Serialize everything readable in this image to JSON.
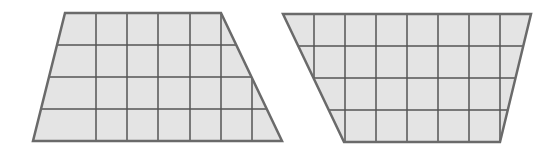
{
  "colors": {
    "fill": "#e4e4e4",
    "grid": "#555555",
    "outline": "#6a6a6a",
    "background": "#ffffff"
  },
  "shapes": [
    {
      "name": "left-trapezoid",
      "rows": 4,
      "top_cells": 5,
      "bottom_cells": 7,
      "polygon": [
        [
          65,
          13
        ],
        [
          221,
          13
        ],
        [
          282,
          141
        ],
        [
          33,
          141
        ]
      ],
      "vertical_lines_x": [
        96,
        127,
        158,
        190,
        221,
        252
      ],
      "horizontal_lines_y": [
        45,
        77,
        109
      ]
    },
    {
      "name": "right-trapezoid",
      "rows": 4,
      "top_cells": 8,
      "bottom_cells": 5,
      "polygon": [
        [
          283,
          14
        ],
        [
          531,
          14
        ],
        [
          500,
          142
        ],
        [
          344,
          142
        ]
      ],
      "vertical_lines_x": [
        314,
        345,
        376,
        407,
        438,
        469,
        500
      ],
      "horizontal_lines_y": [
        46,
        78,
        110
      ]
    }
  ]
}
